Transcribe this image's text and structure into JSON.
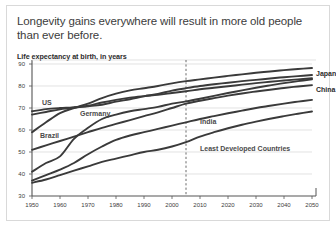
{
  "header": {
    "title": "Longevity gains everywhere will result in more old people than ever before.",
    "subtitle": "Life expectancy at birth, in years"
  },
  "colors": {
    "line": "#3a3a3a",
    "line_light": "#8d8d8d",
    "grid": "#d5d5d5",
    "axis": "#555555",
    "frame": "#d9d9d9",
    "text": "#3c3c3c",
    "background": "#ffffff"
  },
  "labels": {
    "japan": "Japan",
    "china": "China",
    "us": "US",
    "germany": "Germany",
    "brazil": "Brazil",
    "india": "India",
    "ldc": "Least Developed Countries"
  },
  "ticks": {
    "x": [
      "1950",
      "1960",
      "1970",
      "1980",
      "1990",
      "2000",
      "2010",
      "2020",
      "2030",
      "2040",
      "2050"
    ],
    "y": [
      "30",
      "40",
      "50",
      "60",
      "70",
      "80",
      "90"
    ]
  },
  "chart_data": {
    "type": "line",
    "title": "Longevity gains everywhere will result in more old people than ever before.",
    "subtitle": "Life expectancy at birth, in years",
    "xlabel": "",
    "ylabel": "Life expectancy at birth, in years",
    "xlim": [
      1950,
      2050
    ],
    "ylim": [
      30,
      90
    ],
    "xticks": [
      1950,
      1960,
      1970,
      1980,
      1990,
      2000,
      2010,
      2020,
      2030,
      2040,
      2050
    ],
    "yticks": [
      30,
      40,
      50,
      60,
      70,
      80,
      90
    ],
    "grid": "horizontal",
    "legend": "inline-labels",
    "annotations": [
      {
        "type": "vline",
        "x": 2005,
        "style": "dashed",
        "label": ""
      }
    ],
    "x": [
      1950,
      1955,
      1960,
      1965,
      1970,
      1975,
      1980,
      1985,
      1990,
      1995,
      2000,
      2005,
      2010,
      2015,
      2020,
      2025,
      2030,
      2035,
      2040,
      2045,
      2050
    ],
    "series": [
      {
        "name": "Japan",
        "values": [
          59.0,
          63.5,
          67.7,
          70.0,
          72.0,
          74.5,
          76.5,
          78.0,
          79.0,
          80.0,
          81.2,
          82.2,
          83.0,
          83.8,
          84.6,
          85.3,
          86.0,
          86.6,
          87.2,
          87.7,
          88.2
        ]
      },
      {
        "name": "China",
        "values": [
          41.0,
          45.0,
          48.0,
          56.0,
          61.0,
          65.0,
          67.0,
          68.5,
          69.5,
          70.5,
          72.0,
          73.0,
          74.2,
          75.5,
          76.8,
          78.0,
          79.2,
          80.3,
          81.3,
          82.2,
          83.0
        ]
      },
      {
        "name": "US",
        "values": [
          68.5,
          69.5,
          70.0,
          70.3,
          71.0,
          72.5,
          73.7,
          74.7,
          75.4,
          76.0,
          76.8,
          77.6,
          78.5,
          79.2,
          79.9,
          80.6,
          81.3,
          81.9,
          82.5,
          83.0,
          83.5
        ]
      },
      {
        "name": "Germany",
        "values": [
          67.0,
          68.2,
          69.4,
          70.2,
          70.8,
          71.5,
          72.9,
          74.0,
          75.3,
          76.4,
          77.9,
          79.0,
          80.0,
          80.8,
          81.5,
          82.2,
          82.8,
          83.4,
          84.0,
          84.5,
          85.0
        ]
      },
      {
        "name": "Brazil",
        "values": [
          51.0,
          53.0,
          55.0,
          57.0,
          59.0,
          61.0,
          62.8,
          64.5,
          66.3,
          68.0,
          70.0,
          72.0,
          73.3,
          74.5,
          75.6,
          76.6,
          77.5,
          78.3,
          79.1,
          79.8,
          80.4
        ]
      },
      {
        "name": "India",
        "values": [
          37.0,
          39.5,
          42.0,
          45.0,
          49.0,
          52.5,
          55.5,
          57.5,
          59.0,
          60.5,
          62.0,
          63.5,
          65.0,
          66.3,
          67.6,
          68.8,
          70.0,
          71.0,
          72.0,
          72.9,
          73.7
        ]
      },
      {
        "name": "Least Developed Countries",
        "values": [
          36.0,
          37.5,
          39.5,
          41.5,
          43.5,
          45.5,
          47.0,
          48.5,
          50.0,
          51.0,
          52.5,
          54.5,
          57.0,
          59.0,
          60.8,
          62.4,
          63.8,
          65.1,
          66.3,
          67.4,
          68.4
        ]
      }
    ]
  }
}
